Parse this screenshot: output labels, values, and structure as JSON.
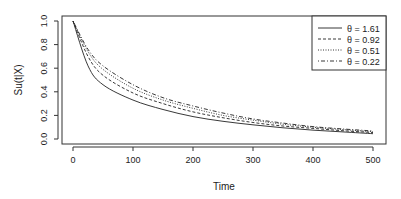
{
  "chart_data": {
    "type": "line",
    "title": "",
    "xlabel": "Time",
    "ylabel": "Su(t|X)",
    "xlim": [
      0,
      500
    ],
    "ylim": [
      0,
      1
    ],
    "xticks": [
      "0",
      "100",
      "200",
      "300",
      "400",
      "500"
    ],
    "yticks": [
      "0.0",
      "0.2",
      "0.4",
      "0.6",
      "0.8",
      "1.0"
    ],
    "legend_position": "top-right",
    "grid": false,
    "x": [
      0,
      25,
      50,
      100,
      150,
      200,
      250,
      300,
      350,
      400,
      450,
      500
    ],
    "series": [
      {
        "name": "θ = 1.61",
        "style": "solid",
        "values": [
          1.0,
          0.62,
          0.46,
          0.33,
          0.25,
          0.19,
          0.15,
          0.12,
          0.095,
          0.075,
          0.06,
          0.045
        ]
      },
      {
        "name": "θ = 0.92",
        "style": "dashed",
        "values": [
          1.0,
          0.7,
          0.54,
          0.39,
          0.3,
          0.23,
          0.18,
          0.14,
          0.11,
          0.09,
          0.07,
          0.055
        ]
      },
      {
        "name": "θ = 0.51",
        "style": "dotted",
        "values": [
          1.0,
          0.74,
          0.59,
          0.43,
          0.33,
          0.26,
          0.2,
          0.16,
          0.125,
          0.1,
          0.08,
          0.062
        ]
      },
      {
        "name": "θ = 0.22",
        "style": "dotdash",
        "values": [
          1.0,
          0.76,
          0.62,
          0.46,
          0.35,
          0.28,
          0.22,
          0.17,
          0.135,
          0.105,
          0.085,
          0.068
        ]
      }
    ]
  }
}
